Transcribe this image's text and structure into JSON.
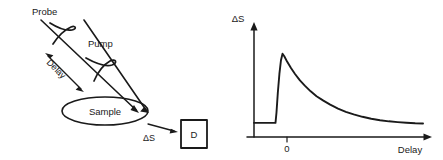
{
  "figure": {
    "width": 443,
    "height": 160,
    "background": "#ffffff",
    "ink_color": "#1a1a1a"
  },
  "diagram": {
    "labels": {
      "probe": "Probe",
      "pump": "Pump",
      "delay": "Delay",
      "sample": "Sample",
      "signal": "ΔS",
      "detector": "D"
    },
    "elements": [
      {
        "name": "probe-beam-arrow",
        "kind": "arrow",
        "from": [
          41,
          20
        ],
        "to": [
          138,
          113
        ]
      },
      {
        "name": "pump-beam-arrow",
        "kind": "arrow",
        "from": [
          84,
          20
        ],
        "to": [
          148,
          113
        ]
      },
      {
        "name": "delay-double-arrow",
        "kind": "double-arrow",
        "from": [
          46,
          55
        ],
        "to": [
          84,
          92
        ]
      },
      {
        "name": "probe-pulse-squiggle",
        "kind": "squiggle"
      },
      {
        "name": "pump-pulse-squiggle",
        "kind": "squiggle"
      },
      {
        "name": "sample-ellipse",
        "kind": "ellipse",
        "cx": 105,
        "cy": 111,
        "rx": 43,
        "ry": 14
      },
      {
        "name": "signal-arrow",
        "kind": "arrow",
        "from": [
          146,
          123
        ],
        "to": [
          178,
          133
        ]
      },
      {
        "name": "detector-box",
        "kind": "rect",
        "x": 181,
        "y": 120,
        "width": 26,
        "height": 28
      }
    ]
  },
  "chart_data": {
    "type": "line",
    "title": "",
    "xlabel": "Delay",
    "ylabel": "ΔS",
    "xtick_labels": [
      "0"
    ],
    "xtick_values": [
      0
    ],
    "ytick_labels": [],
    "grid": false,
    "legend": null,
    "axis_arrowheads": true,
    "xlim": [
      -1.1,
      7.6
    ],
    "ylim": [
      0,
      1.25
    ],
    "annotations": [
      "flat baseline before time zero",
      "sharp rise just after zero to peak",
      "exponential decay toward baseline"
    ],
    "series": [
      {
        "name": "transient signal",
        "color": "#1a1a1a",
        "x": [
          -1.1,
          -0.9,
          -0.7,
          -0.5,
          -0.3,
          -0.15,
          -0.05,
          0.0,
          0.05,
          0.12,
          0.2,
          0.28,
          0.36,
          0.45,
          0.6,
          0.8,
          1.0,
          1.25,
          1.5,
          1.8,
          2.1,
          2.45,
          2.8,
          3.2,
          3.6,
          4.0,
          4.45,
          4.9,
          5.35,
          5.8,
          6.25,
          6.7,
          7.15,
          7.55
        ],
        "y": [
          0.175,
          0.175,
          0.175,
          0.175,
          0.175,
          0.175,
          0.175,
          0.175,
          0.3,
          0.55,
          0.78,
          0.95,
          1.03,
          1.0,
          0.93,
          0.85,
          0.78,
          0.7,
          0.635,
          0.565,
          0.505,
          0.45,
          0.4,
          0.352,
          0.312,
          0.28,
          0.25,
          0.226,
          0.208,
          0.194,
          0.184,
          0.176,
          0.17,
          0.167
        ]
      }
    ]
  }
}
